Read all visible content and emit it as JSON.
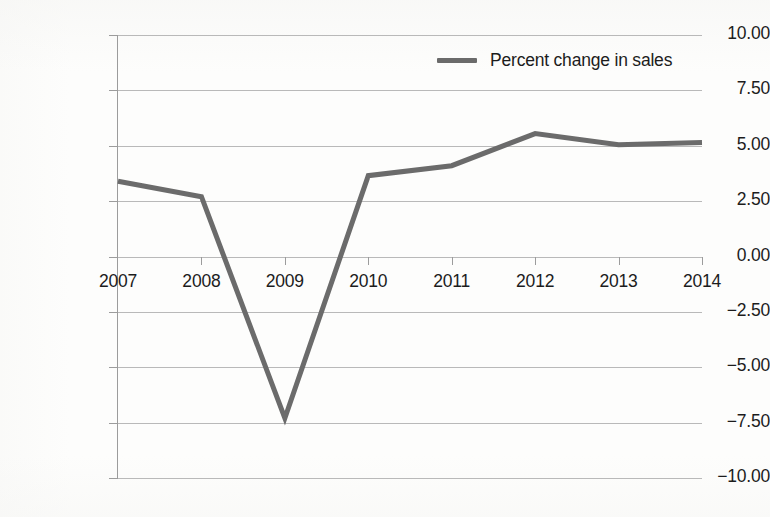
{
  "chart_data": {
    "type": "line",
    "title": "",
    "xlabel": "",
    "ylabel": "",
    "categories": [
      "2007",
      "2008",
      "2009",
      "2010",
      "2011",
      "2012",
      "2013",
      "2014"
    ],
    "series": [
      {
        "name": "Percent change in sales",
        "color": "#6b6b6b",
        "values": [
          3.4,
          2.7,
          -7.3,
          3.65,
          4.1,
          5.55,
          5.05,
          5.15
        ]
      }
    ],
    "ylim": [
      -10.0,
      10.0
    ],
    "ytick_step": 2.5,
    "ytick_labels": [
      "10.00",
      "7.50",
      "5.00",
      "2.50",
      "0.00",
      "−2.50",
      "−5.00",
      "−7.50",
      "−10.00"
    ],
    "ytick_values": [
      10.0,
      7.5,
      5.0,
      2.5,
      0.0,
      -2.5,
      -5.0,
      -7.5,
      -10.0
    ],
    "xtick_labels": [
      "2007",
      "2008",
      "2009",
      "2010",
      "2011",
      "2012",
      "2013",
      "2014"
    ],
    "grid": true,
    "grid_color": "#b9b9b9",
    "legend": {
      "position": "top-right",
      "entries": [
        {
          "label": "Percent change in sales",
          "color": "#6b6b6b",
          "marker": "line-swatch"
        }
      ]
    },
    "axis_color": "#9c9c9c",
    "background": "#fdfdfc",
    "text_color": "#1c1c1c"
  }
}
